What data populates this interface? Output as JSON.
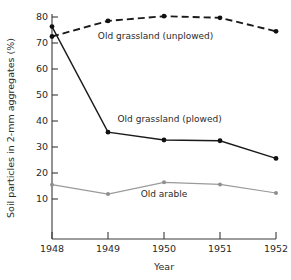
{
  "chart_data": {
    "type": "line",
    "title": "",
    "xlabel": "Year",
    "ylabel": "Soil particles in 2-mm aggregates (%)",
    "x": [
      1948,
      1949,
      1950,
      1951,
      1952
    ],
    "xtick_labels": [
      "1948",
      "1949",
      "1950",
      "1951",
      "1952"
    ],
    "ytick_labels": [
      "10",
      "20",
      "30",
      "40",
      "50",
      "60",
      "70",
      "80"
    ],
    "yticks": [
      10,
      20,
      30,
      40,
      50,
      60,
      70,
      80
    ],
    "xlim": [
      1948,
      1952
    ],
    "ylim": [
      5,
      82
    ],
    "grid": false,
    "legend_position": "inline-annotations",
    "series": [
      {
        "name": "Old grassland (unplowed)",
        "values": [
          72.5,
          78.5,
          80.3,
          79.7,
          74.5
        ],
        "style": "dashed",
        "color": "#1a1a1a",
        "marker": "filled-circle",
        "label_x": 1949.85,
        "label_y": 71.5
      },
      {
        "name": "Old grassland (plowed)",
        "values": [
          76.3,
          35.7,
          32.7,
          32.4,
          25.6
        ],
        "style": "solid",
        "color": "#1a1a1a",
        "marker": "filled-circle",
        "label_x": 1950.1,
        "label_y": 39.5
      },
      {
        "name": "Old arable",
        "values": [
          15.5,
          11.9,
          16.4,
          15.6,
          12.3
        ],
        "style": "solid",
        "color": "#9a9a9a",
        "marker": "filled-circle",
        "label_x": 1950.0,
        "label_y": 10.7
      }
    ]
  },
  "annotations": {
    "unplowed_label": "Old grassland (unplowed)",
    "plowed_label": "Old grassland (plowed)",
    "arable_label": "Old arable"
  },
  "axes": {
    "x_title": "Year",
    "y_title": "Soil particles in 2-mm aggregates (%)"
  }
}
